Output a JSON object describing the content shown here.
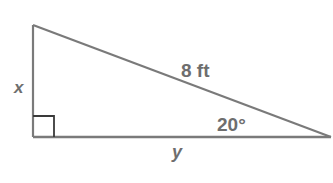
{
  "diagram": {
    "type": "right-triangle",
    "labels": {
      "vertical_leg": "x",
      "horizontal_leg": "y",
      "hypotenuse": "8 ft",
      "angle": "20°"
    },
    "vertices": {
      "top": [
        33,
        25
      ],
      "right_angle": [
        33,
        137
      ],
      "acute": [
        331,
        137
      ]
    },
    "right_angle_marker_size": 21,
    "colors": {
      "stroke": "#7a7a7a",
      "marker": "#3a3a3a",
      "text": "#6e6e6e",
      "background": "#ffffff"
    }
  }
}
